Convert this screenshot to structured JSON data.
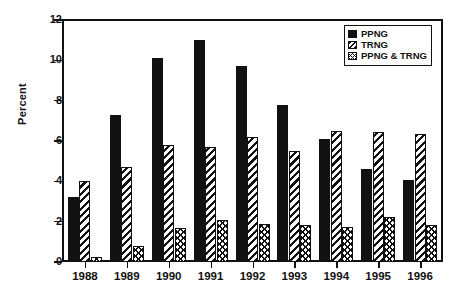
{
  "chart_data": {
    "type": "bar",
    "title": "",
    "xlabel": "",
    "ylabel": "Percent",
    "ylim": [
      0,
      12
    ],
    "yticks": [
      0,
      2,
      4,
      6,
      8,
      10,
      12
    ],
    "ytick_labels": [
      "0",
      "2",
      "4",
      "6",
      "8",
      "10",
      "12"
    ],
    "grid": false,
    "legend_position": "top-right",
    "categories": [
      "1988",
      "1989",
      "1990",
      "1991",
      "1992",
      "1993",
      "1994",
      "1995",
      "1996"
    ],
    "series": [
      {
        "name": "PPNG",
        "pattern": "solid",
        "values": [
          3.2,
          7.3,
          10.1,
          11.0,
          9.7,
          7.8,
          6.1,
          4.6,
          4.05
        ]
      },
      {
        "name": "TRNG",
        "pattern": "hatch",
        "values": [
          4.0,
          4.7,
          5.8,
          5.7,
          6.2,
          5.5,
          6.5,
          6.45,
          6.35
        ]
      },
      {
        "name": "PPNG & TRNG",
        "pattern": "cross",
        "values": [
          0.25,
          0.8,
          1.7,
          2.1,
          1.9,
          1.85,
          1.75,
          2.25,
          1.85
        ]
      }
    ]
  },
  "colors": {
    "ink": "#111111",
    "background": "#ffffff"
  }
}
